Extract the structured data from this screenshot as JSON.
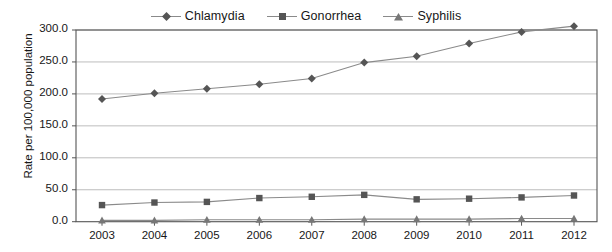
{
  "chart_data": {
    "type": "line",
    "title": "",
    "xlabel": "",
    "ylabel": "Rate per 100,000 population",
    "categories": [
      "2003",
      "2004",
      "2005",
      "2006",
      "2007",
      "2008",
      "2009",
      "2010",
      "2011",
      "2012"
    ],
    "ylim": [
      0.0,
      300.0
    ],
    "ytick_labels": [
      "300.0",
      "250.0",
      "200.0",
      "150.0",
      "100.0",
      "50.0",
      "0.0"
    ],
    "ytick_values": [
      300.0,
      250.0,
      200.0,
      150.0,
      100.0,
      50.0,
      0.0
    ],
    "grid": "horizontal",
    "legend_position": "top-center",
    "series": [
      {
        "name": "Chlamydia",
        "marker": "diamond",
        "color": "#555555",
        "values": [
          192,
          201,
          208,
          215,
          224,
          249,
          259,
          279,
          297,
          306
        ]
      },
      {
        "name": "Gonorrhea",
        "marker": "square",
        "color": "#555555",
        "values": [
          26,
          30,
          31,
          37,
          39,
          42,
          35,
          36,
          38,
          41
        ]
      },
      {
        "name": "Syphilis",
        "marker": "triangle",
        "color": "#777777",
        "values": [
          2,
          2,
          3,
          3,
          3,
          4,
          4,
          4,
          5,
          5
        ]
      }
    ]
  },
  "colors": {
    "line": "#8a8a8a",
    "grid": "#bdbdbd",
    "axis": "#555555",
    "text": "#171717"
  }
}
